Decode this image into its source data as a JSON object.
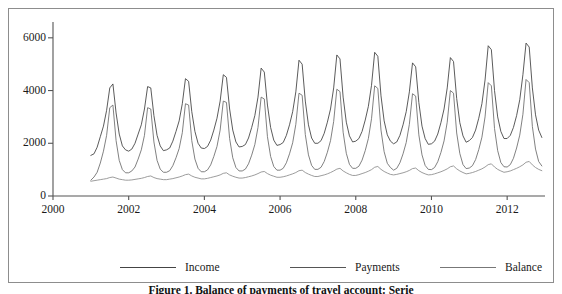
{
  "figure": {
    "caption": "Figure 1. Balance of payments of travel account: Serie"
  },
  "legend": {
    "position": "bottom",
    "items": [
      {
        "label": "Income",
        "color": "#444444"
      },
      {
        "label": "Payments",
        "color": "#555555"
      },
      {
        "label": "Balance",
        "color": "#777777"
      }
    ]
  },
  "chart_data": {
    "type": "line",
    "title": "",
    "xlabel": "",
    "ylabel": "",
    "xlim": [
      2000.0,
      2013.0
    ],
    "ylim": [
      0,
      6600
    ],
    "xticks": [
      2000,
      2002,
      2004,
      2006,
      2008,
      2010,
      2012
    ],
    "xticklabels": [
      "2000",
      "2002",
      "2004",
      "2006",
      "2008",
      "2010",
      "2012"
    ],
    "yticks": [
      0,
      2000,
      4000,
      6000
    ],
    "yticklabels": [
      "0",
      "2000",
      "4000",
      "6000"
    ],
    "grid": false,
    "x_start": 2001.0,
    "x_step": 0.08333,
    "series": [
      {
        "name": "Income",
        "color": "#3d3d3d",
        "values": [
          1540,
          1600,
          1850,
          2250,
          2650,
          3250,
          4100,
          4250,
          3150,
          2350,
          1900,
          1750,
          1700,
          1780,
          2000,
          2350,
          2700,
          3300,
          4150,
          4100,
          3050,
          2300,
          1900,
          1720,
          1750,
          1820,
          2080,
          2450,
          2850,
          3500,
          4450,
          4350,
          3200,
          2450,
          2000,
          1820,
          1800,
          1880,
          2120,
          2500,
          2950,
          3600,
          4600,
          4500,
          3300,
          2500,
          2050,
          1860,
          1880,
          1950,
          2200,
          2600,
          3050,
          3750,
          4850,
          4700,
          3450,
          2600,
          2120,
          1920,
          1950,
          2030,
          2300,
          2700,
          3200,
          3950,
          5150,
          5000,
          3600,
          2700,
          2200,
          2000,
          2000,
          2100,
          2380,
          2800,
          3300,
          4100,
          5350,
          5200,
          3750,
          2800,
          2280,
          2050,
          2080,
          2180,
          2450,
          2880,
          3400,
          4200,
          5450,
          5300,
          3800,
          2850,
          2320,
          2080,
          1980,
          2050,
          2300,
          2700,
          3200,
          3950,
          5050,
          4900,
          3550,
          2650,
          2180,
          1960,
          1980,
          2080,
          2350,
          2780,
          3300,
          4100,
          5250,
          5100,
          3700,
          2780,
          2280,
          2040,
          2100,
          2220,
          2500,
          2950,
          3500,
          4400,
          5700,
          5550,
          4000,
          3000,
          2450,
          2180,
          2180,
          2300,
          2600,
          3050,
          3650,
          4600,
          5800,
          5650,
          4100,
          3080,
          2500,
          2220
        ]
      },
      {
        "name": "Payments",
        "color": "#6a6a6a",
        "values": [
          600,
          720,
          900,
          1250,
          1700,
          2300,
          3350,
          3450,
          2100,
          1350,
          1000,
          880,
          880,
          950,
          1100,
          1400,
          1750,
          2300,
          3350,
          3300,
          2050,
          1350,
          1020,
          900,
          900,
          960,
          1150,
          1450,
          1800,
          2400,
          3500,
          3450,
          2100,
          1400,
          1050,
          920,
          920,
          990,
          1180,
          1500,
          1880,
          2500,
          3600,
          3550,
          2180,
          1450,
          1080,
          950,
          950,
          1020,
          1220,
          1550,
          1950,
          2600,
          3750,
          3680,
          2250,
          1500,
          1120,
          980,
          980,
          1050,
          1260,
          1600,
          2020,
          2720,
          3900,
          3820,
          2330,
          1560,
          1160,
          1010,
          1010,
          1090,
          1310,
          1660,
          2100,
          2830,
          4050,
          3960,
          2420,
          1620,
          1200,
          1050,
          1050,
          1130,
          1360,
          1720,
          2180,
          2930,
          4180,
          4080,
          2500,
          1680,
          1240,
          1080,
          980,
          1050,
          1260,
          1600,
          2030,
          2720,
          3880,
          3790,
          2320,
          1560,
          1160,
          1010,
          1000,
          1080,
          1300,
          1650,
          2090,
          2800,
          4000,
          3900,
          2390,
          1610,
          1190,
          1040,
          1060,
          1150,
          1380,
          1760,
          2230,
          3000,
          4300,
          4180,
          2560,
          1720,
          1270,
          1110,
          1100,
          1190,
          1430,
          1820,
          2310,
          3100,
          4420,
          4300,
          2640,
          1780,
          1310,
          1140
        ]
      },
      {
        "name": "Balance",
        "color": "#8a8a8a",
        "values": [
          560,
          580,
          600,
          620,
          640,
          660,
          700,
          720,
          680,
          640,
          620,
          600,
          600,
          610,
          630,
          650,
          670,
          700,
          740,
          760,
          700,
          660,
          640,
          620,
          620,
          640,
          660,
          690,
          720,
          760,
          810,
          830,
          760,
          710,
          680,
          650,
          650,
          670,
          700,
          730,
          760,
          800,
          860,
          880,
          800,
          750,
          710,
          680,
          680,
          700,
          730,
          760,
          800,
          850,
          910,
          930,
          850,
          790,
          750,
          710,
          710,
          730,
          760,
          800,
          840,
          890,
          960,
          980,
          890,
          830,
          780,
          740,
          740,
          770,
          800,
          840,
          890,
          950,
          1020,
          1050,
          950,
          880,
          820,
          780,
          780,
          810,
          850,
          890,
          940,
          1000,
          1090,
          1120,
          1010,
          930,
          870,
          820,
          800,
          820,
          850,
          880,
          920,
          970,
          1040,
          1060,
          960,
          890,
          840,
          800,
          810,
          840,
          880,
          920,
          970,
          1030,
          1110,
          1140,
          1030,
          950,
          890,
          840,
          860,
          890,
          930,
          980,
          1030,
          1100,
          1190,
          1220,
          1100,
          1010,
          950,
          900,
          920,
          950,
          1000,
          1050,
          1110,
          1180,
          1280,
          1310,
          1180,
          1080,
          1010,
          960
        ]
      }
    ]
  }
}
